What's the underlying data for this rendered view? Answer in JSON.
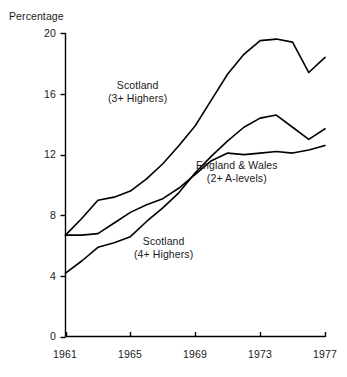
{
  "chart_data": {
    "type": "line",
    "title": "",
    "subtitle": "",
    "xlabel": "",
    "ylabel": "Percentage",
    "xlim": [
      1961,
      1977
    ],
    "ylim": [
      0,
      20
    ],
    "grid": false,
    "legend_position": "inline-annotations",
    "xticks": [
      "1961",
      "1965",
      "1969",
      "1973",
      "1977"
    ],
    "xtick_values": [
      1961,
      1965,
      1969,
      1973,
      1977
    ],
    "yticks": [
      "0",
      "4",
      "8",
      "12",
      "16",
      "20"
    ],
    "ytick_values": [
      0,
      4,
      8,
      12,
      16,
      20
    ],
    "x": [
      1961,
      1962,
      1963,
      1964,
      1965,
      1966,
      1967,
      1968,
      1969,
      1970,
      1971,
      1972,
      1973,
      1974,
      1975,
      1976,
      1977
    ],
    "series": [
      {
        "name": "Scotland (3+ Highers)",
        "label_line1": "Scotland",
        "label_line2": "(3+ Highers)",
        "color": "#000000",
        "values": [
          6.7,
          7.8,
          9.0,
          9.2,
          9.6,
          10.4,
          11.4,
          12.6,
          13.9,
          15.6,
          17.3,
          18.6,
          19.5,
          19.6,
          19.4,
          17.4,
          18.4
        ]
      },
      {
        "name": "Scotland (4+ Highers)",
        "label_line1": "Scotland",
        "label_line2": "(4+ Highers)",
        "color": "#000000",
        "values": [
          4.2,
          5.0,
          5.9,
          6.2,
          6.6,
          7.6,
          8.5,
          9.5,
          10.8,
          11.9,
          12.9,
          13.8,
          14.4,
          14.6,
          13.8,
          13.0,
          13.7
        ]
      },
      {
        "name": "England & Wales (2+ A-levels)",
        "label_line1": "England & Wales",
        "label_line2": "(2+ A-levels)",
        "color": "#000000",
        "values": [
          6.7,
          6.7,
          6.8,
          7.5,
          8.2,
          8.7,
          9.1,
          9.8,
          10.7,
          11.6,
          12.1,
          12.0,
          12.1,
          12.2,
          12.1,
          12.3,
          12.6
        ]
      }
    ]
  },
  "axes": {
    "y_axis_title": "Percentage",
    "ytick_labels": [
      "20",
      "16",
      "12",
      "8",
      "4",
      "0"
    ],
    "xtick_labels": [
      "1961",
      "1965",
      "1969",
      "1973",
      "1977"
    ]
  },
  "annotations": {
    "scotland_3_line1": "Scotland",
    "scotland_3_line2": "(3+ Highers)",
    "england_wales_line1": "England & Wales",
    "england_wales_line2": "(2+ A-levels)",
    "scotland_4_line1": "Scotland",
    "scotland_4_line2": "(4+ Highers)"
  }
}
